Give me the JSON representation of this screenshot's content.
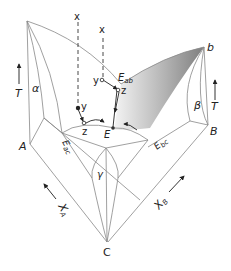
{
  "figure": {
    "type": "ternary eutectic phase diagram (3D perspective)",
    "labels": {
      "x_top_left": "x",
      "x_top_right": "x",
      "y_left": "y",
      "y_right": "y",
      "z_left": "z",
      "z_right": "z",
      "E": "E",
      "E_ab_main": "E",
      "E_ab_sub": "ab",
      "E_ac_main": "E",
      "E_ac_sub": "ac",
      "E_bc_main": "E",
      "E_bc_sub": "bc",
      "alpha": "α",
      "beta": "β",
      "gamma": "γ",
      "A": "A",
      "B": "B",
      "C": "C",
      "b": "b",
      "T_left": "T",
      "T_right": "T",
      "XA_main": "X",
      "XA_sub": "A",
      "XB_main": "X",
      "XB_sub": "B"
    },
    "colors": {
      "edge": "#888888",
      "ink": "#222222",
      "shade_dark": "#8a8a8a",
      "shade_light": "#f2f2f2"
    }
  }
}
